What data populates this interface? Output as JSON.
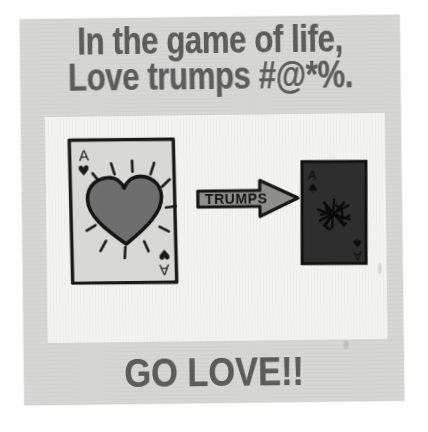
{
  "poster": {
    "headline_line1": "In the game of life,",
    "headline_line2": "Love trumps #@*%.",
    "footer": "GO LOVE!!",
    "colors": {
      "paper": "#d6d7d3",
      "panel": "#f3f3f0",
      "text": "#5b5c5b",
      "ink": "#1a1a1a",
      "heart_fill": "#6e6e6e",
      "card_face": "#d8d8d4",
      "dark_card_fill": "#2e2e2e",
      "arrow_fill": "#8e8e8a"
    }
  },
  "illustration": {
    "love_card": {
      "name": "ace-of-hearts-card",
      "rank": "A",
      "suit_symbol": "♥",
      "suit_name": "hearts",
      "corner_top_left": "A ♥",
      "corner_bottom_right": "A ♥",
      "center_motif": "radiant-heart",
      "ray_count": 10
    },
    "arrow": {
      "name": "trumps-arrow",
      "label": "TRUMPS",
      "direction": "right"
    },
    "hate_card": {
      "name": "ace-of-spades-card",
      "rank": "A",
      "suit_symbol": "♠",
      "suit_name": "spades",
      "corner_top_left": "A ♠",
      "corner_bottom_right": "A ♠",
      "center_motif": "scribbled-expletive-splat"
    }
  }
}
